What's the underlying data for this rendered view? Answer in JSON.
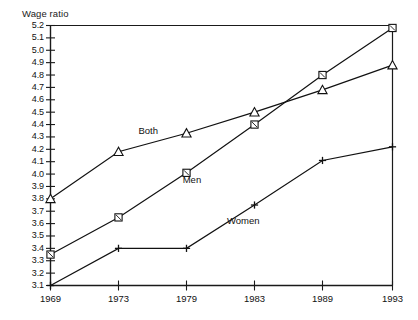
{
  "titles": {
    "clipped_top_title": "",
    "y_axis_title": "Wage ratio"
  },
  "chart_data": {
    "type": "line",
    "title": "Wage ratio",
    "xlabel": "",
    "ylabel": "Wage ratio",
    "x": [
      "1969",
      "1973",
      "1979",
      "1983",
      "1989",
      "1993"
    ],
    "categories": [
      "1969",
      "1973",
      "1979",
      "1983",
      "1989",
      "1993"
    ],
    "ylim": [
      3.1,
      5.2
    ],
    "ytick_labels": [
      "5.2",
      "5.1",
      "5.0",
      "4.9",
      "4.8",
      "4.7",
      "4.6",
      "4.5",
      "4.4",
      "4.3",
      "4.2",
      "4.1",
      "4.0",
      "3.9",
      "3.8",
      "3.7",
      "3.6",
      "3.5",
      "3.4",
      "3.3",
      "3.2",
      "3.1"
    ],
    "xtick_labels": [
      "1969",
      "1973",
      "1979",
      "1983",
      "1989",
      "1993"
    ],
    "grid": false,
    "legend": "inline-annotations",
    "series": [
      {
        "name": "Both",
        "marker": "triangle",
        "color": "#111111",
        "values": [
          3.8,
          4.18,
          4.33,
          4.5,
          4.68,
          4.88
        ]
      },
      {
        "name": "Men",
        "marker": "square",
        "color": "#111111",
        "values": [
          3.35,
          3.65,
          4.01,
          4.4,
          4.8,
          5.18
        ]
      },
      {
        "name": "Women",
        "marker": "plus",
        "color": "#111111",
        "values": [
          3.1,
          3.4,
          3.4,
          3.75,
          4.11,
          4.22
        ]
      }
    ],
    "annotations": [
      {
        "text": "Both",
        "x": 1976.0,
        "y": 4.35
      },
      {
        "text": "Men",
        "x": 1979.6,
        "y": 3.95
      },
      {
        "text": "Women",
        "x": 1982.2,
        "y": 3.62
      }
    ]
  },
  "colors": {
    "axis": "#1a1a1a",
    "line": "#111111",
    "text": "#111111",
    "background": "#ffffff"
  }
}
